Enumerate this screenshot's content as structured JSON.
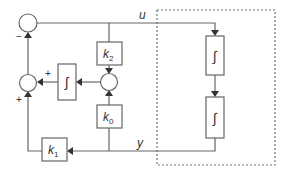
{
  "diagram": {
    "signals": {
      "u": "u",
      "y": "y"
    },
    "blocks": {
      "k2": {
        "base": "k",
        "sub": "2"
      },
      "k0": {
        "base": "k",
        "sub": "0"
      },
      "k1": {
        "base": "k",
        "sub": "1"
      },
      "integrator_feedback": "∫",
      "integrator_plant_1": "∫",
      "integrator_plant_2": "∫"
    },
    "signs": {
      "top_junction_bottom": "−",
      "left_junction_right": "+",
      "left_junction_bottom": "+"
    },
    "colors": {
      "line": "#666666",
      "text": "#333333",
      "dashed_box": "#777777"
    }
  }
}
